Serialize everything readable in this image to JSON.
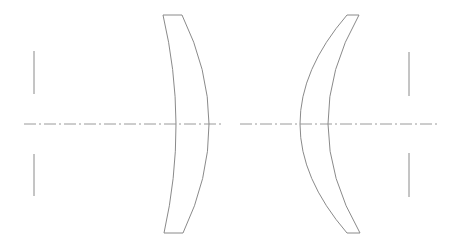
{
  "diagram": {
    "type": "optical-lens-layout",
    "colors": {
      "background": "#ffffff",
      "line": "#8a8a8a",
      "axis": "#9a9a9a"
    },
    "optical_axis": {
      "y": 124,
      "dash_pattern": "12 3 2 3",
      "segments": [
        {
          "x1": 24,
          "x2": 222
        },
        {
          "x1": 240,
          "x2": 438
        }
      ]
    },
    "stops": [
      {
        "name": "left-aperture-stop",
        "x": 34,
        "upper": [
          51,
          94
        ],
        "lower": [
          154,
          196
        ]
      },
      {
        "name": "right-aperture-stop",
        "x": 409,
        "upper": [
          52,
          96
        ],
        "lower": [
          153,
          197
        ]
      }
    ],
    "lenses": [
      {
        "name": "left-meniscus-lens",
        "top": {
          "x1": 163,
          "x2": 182,
          "y": 15
        },
        "bottom": {
          "x1": 164,
          "x2": 183,
          "y": 233
        },
        "inner_vertex_x": 176,
        "outer_vertex_x": 209
      },
      {
        "name": "right-meniscus-lens",
        "top": {
          "x1": 347,
          "x2": 359,
          "y": 15
        },
        "bottom": {
          "x1": 347,
          "x2": 360,
          "y": 233
        },
        "outer_vertex_x": 300,
        "inner_vertex_x": 328
      }
    ]
  }
}
